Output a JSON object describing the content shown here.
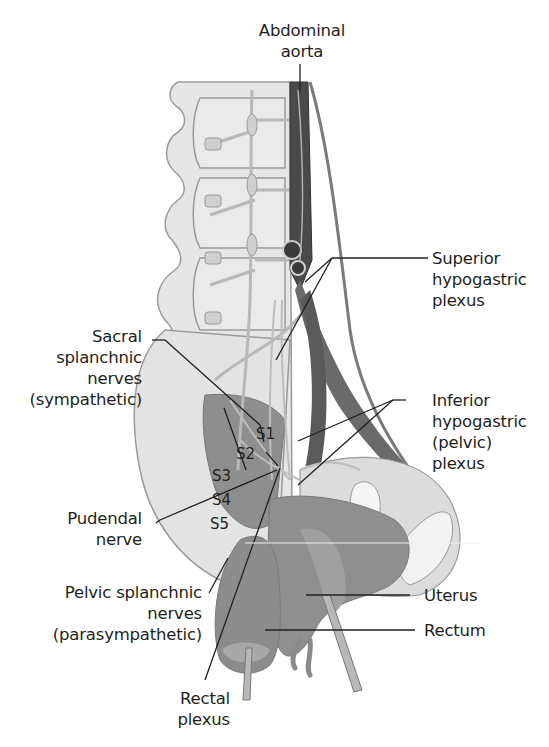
{
  "diagram": {
    "type": "anatomical-illustration",
    "colors": {
      "background": "#ffffff",
      "bone": "#e6e6e6",
      "bone_outline": "#9a9a9a",
      "nerve": "#b8b8b8",
      "vessel": "#5a5a5a",
      "vessel_dark": "#3e3e3e",
      "organ": "#8f8f8f",
      "organ_light": "#a8a8a8",
      "muscle": "#8a8a8a",
      "leader_line": "#231f20",
      "text": "#231f20"
    }
  },
  "labels": {
    "abdominal_aorta": [
      "Abdominal",
      "aorta"
    ],
    "superior_hypogastric": [
      "Superior",
      "hypogastric",
      "plexus"
    ],
    "sacral_splanchnic": [
      "Sacral",
      "splanchnic",
      "nerves",
      "(sympathetic)"
    ],
    "inferior_hypogastric": [
      "Inferior",
      "hypogastric",
      "(pelvic)",
      "plexus"
    ],
    "pudendal": [
      "Pudendal",
      "nerve"
    ],
    "pelvic_splanchnic": [
      "Pelvic splanchnic",
      "nerves",
      "(parasympathetic)"
    ],
    "uterus": [
      "Uterus"
    ],
    "rectum": [
      "Rectum"
    ],
    "rectal_plexus": [
      "Rectal",
      "plexus"
    ]
  },
  "sacral_segments": [
    "S1",
    "S2",
    "S3",
    "S4",
    "S5"
  ]
}
